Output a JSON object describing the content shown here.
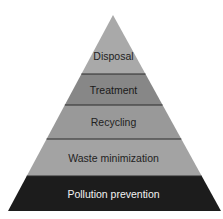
{
  "diagram": {
    "type": "pyramid",
    "apex": {
      "x": 113,
      "y": 15
    },
    "base": {
      "y": 211,
      "left": 8,
      "right": 221
    },
    "layers": [
      {
        "label": "Disposal",
        "top": 15,
        "bottom": 74,
        "fill": "#a9a9a9",
        "text_color": "#222222"
      },
      {
        "label": "Treatment",
        "top": 74,
        "bottom": 105,
        "fill": "#878787",
        "text_color": "#1a1a1a"
      },
      {
        "label": "Recycling",
        "top": 105,
        "bottom": 139,
        "fill": "#999999",
        "text_color": "#222222"
      },
      {
        "label": "Waste minimization",
        "top": 139,
        "bottom": 176,
        "fill": "#a3a3a3",
        "text_color": "#222222"
      },
      {
        "label": "Pollution prevention",
        "top": 176,
        "bottom": 211,
        "fill": "#1c1c1c",
        "text_color": "#f2f2f2"
      }
    ],
    "divider_color": "#2a2a2a"
  }
}
